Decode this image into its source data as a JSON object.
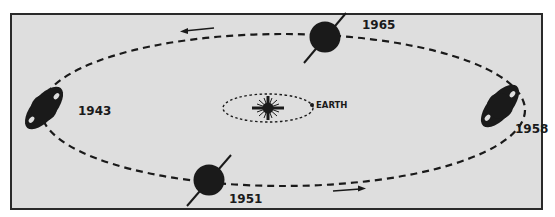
{
  "diagram": {
    "colors": {
      "background": "#dedede",
      "ink": "#1a1a1a",
      "border": "#2a2a2a"
    },
    "center": {
      "label": "EARTH",
      "sun_icon": "sun-star-icon"
    },
    "positions": [
      {
        "year": "1943",
        "ring_view": "open"
      },
      {
        "year": "1951",
        "ring_view": "edge-on"
      },
      {
        "year": "1958",
        "ring_view": "open"
      },
      {
        "year": "1965",
        "ring_view": "edge-on"
      }
    ],
    "arrows": [
      {
        "location": "top",
        "direction": "left"
      },
      {
        "location": "bottom",
        "direction": "right"
      }
    ]
  }
}
